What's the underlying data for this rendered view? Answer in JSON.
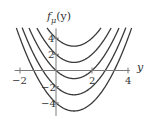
{
  "chart_data": {
    "type": "line",
    "title": "",
    "ylabel": "f_μ(y)",
    "ylabel_display": {
      "base": "f",
      "sub": "μ",
      "arg": "(y)"
    },
    "xlabel": "y",
    "function": "f_μ(y) = y^2 - 2y + μ",
    "xlim": [
      -2.3,
      4.2
    ],
    "ylim": [
      -5.5,
      5.3
    ],
    "x_ticks": [
      {
        "value": -2,
        "label": "−2"
      },
      {
        "value": 2,
        "label": "2"
      },
      {
        "value": 4,
        "label": "4"
      }
    ],
    "y_ticks": [
      {
        "value": 4,
        "label": "4"
      },
      {
        "value": 2,
        "label": "2"
      },
      {
        "value": -2,
        "label": "−2"
      },
      {
        "value": -4,
        "label": "−4"
      }
    ],
    "grid": false,
    "legend": null,
    "series": [
      {
        "name": "μ = 4",
        "mu": 4,
        "vertex": [
          1,
          3
        ]
      },
      {
        "name": "μ = 2",
        "mu": 2,
        "vertex": [
          1,
          1
        ]
      },
      {
        "name": "μ = 0",
        "mu": 0,
        "vertex": [
          1,
          -1
        ]
      },
      {
        "name": "μ = −2",
        "mu": -2,
        "vertex": [
          1,
          -3
        ]
      },
      {
        "name": "μ = −4",
        "mu": -4,
        "vertex": [
          1,
          -5
        ]
      }
    ]
  },
  "colors": {
    "curve": "#3a3a3a",
    "axis": "#7a7a7a",
    "text": "#333333",
    "background": "#ffffff"
  }
}
